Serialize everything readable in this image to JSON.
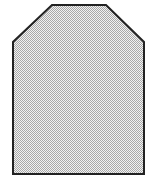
{
  "shape": {
    "name": "clipped-corner-rectangle",
    "points": "52,5 106,5 144,42 144,174 13,174 13,42",
    "stroke": "#222222",
    "stroke_width": 2,
    "fill_pattern": {
      "dot_color": "#a8a8a8",
      "bg_color": "#f2f2f2",
      "cell": 2
    }
  }
}
